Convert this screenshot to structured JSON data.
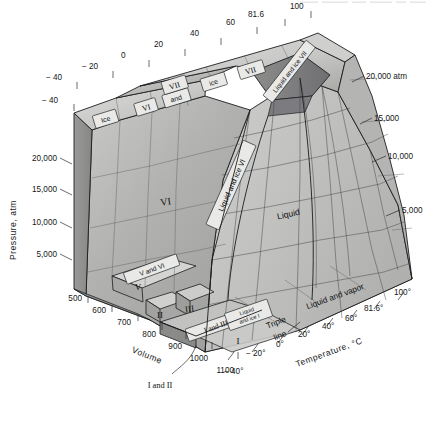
{
  "figure": {
    "type": "pvt-phase-diagram",
    "background_color": "#ffffff",
    "line_color": "#1b1d1f"
  },
  "axes": {
    "pressure": {
      "title": "Pressure, atm",
      "orientation": "vertical-left",
      "ticks": [
        "20,000",
        "15,000",
        "10,000",
        "5,000"
      ]
    },
    "pressure_right": {
      "orientation": "vertical-right",
      "ticks": [
        "20,000 atm",
        "15,000",
        "10,000",
        "5,000"
      ]
    },
    "volume": {
      "title": "Volume",
      "orientation": "depth-lower-left",
      "ticks": [
        "500",
        "600",
        "700",
        "800",
        "900",
        "1000",
        "1100"
      ]
    },
    "temperature_bottom": {
      "title": "Temperature, °C",
      "orientation": "depth-lower-right",
      "ticks": [
        "− 40°",
        "− 20°",
        "0°",
        "20°",
        "40°",
        "60°",
        "81.6°",
        "100°"
      ]
    },
    "temperature_top": {
      "orientation": "depth-upper",
      "ticks": [
        "− 40",
        "− 20",
        "0",
        "20",
        "40",
        "60",
        "81.6",
        "100"
      ]
    }
  },
  "regions": [
    {
      "id": "ice-vi-and-vii",
      "label": "Ice VI and VII",
      "style": "boxed-band"
    },
    {
      "id": "ice-vii",
      "label": "ice VII",
      "style": "boxed-band"
    },
    {
      "id": "liquid-and-ice-vii",
      "label": "Liquid and ice VII",
      "style": "boxed-band"
    },
    {
      "id": "vi",
      "label": "VI",
      "style": "plain"
    },
    {
      "id": "liquid-and-ice-vi",
      "label": "Liquid and ice VI",
      "style": "boxed-band"
    },
    {
      "id": "liquid",
      "label": "Liquid",
      "style": "plain"
    },
    {
      "id": "liquid-and-vapor",
      "label": "Liquid and vapor",
      "style": "plain"
    },
    {
      "id": "v-and-vi",
      "label": "V and VI",
      "style": "boxed-band"
    },
    {
      "id": "v",
      "label": "V",
      "style": "plain"
    },
    {
      "id": "ii",
      "label": "II",
      "style": "plain"
    },
    {
      "id": "iii",
      "label": "III",
      "style": "plain"
    },
    {
      "id": "i-and-iii",
      "label": "I and III",
      "style": "boxed-band"
    },
    {
      "id": "liquid-and-ice-i",
      "label": "Liquid and ice I",
      "style": "boxed-band"
    },
    {
      "id": "i",
      "label": "I",
      "style": "plain"
    },
    {
      "id": "i-and-ii",
      "label": "I and II",
      "style": "callout"
    },
    {
      "id": "triple-line",
      "label": "Triple line",
      "style": "callout"
    }
  ],
  "region_labels": {
    "ice_vi_and_vii_a": "Ice",
    "ice_vi_and_vii_b": "VI",
    "ice_vi_and_vii_c": "and",
    "ice_vi_and_vii_d": "VII",
    "ice_vii_a": "ice",
    "ice_vii_b": "VII",
    "liquid_and_ice_vii": "Liquid and ice VII",
    "vi": "VI",
    "liquid_and_ice_vi": "Liquid and ice VI",
    "liquid": "Liquid",
    "liquid_and_vapor": "Liquid and vapor",
    "v_and_vi": "V and VI",
    "v": "V",
    "ii": "II",
    "iii": "III",
    "i_and_iii": "I and III",
    "liquid_and_ice_i_a": "Liquid",
    "liquid_and_ice_i_b": "and ice I",
    "i": "I",
    "i_and_ii": "I and II",
    "triple_a": "Triple",
    "triple_b": "line"
  },
  "surface_colors": {
    "top_light": "#d8d8d6",
    "top_mid": "#c4c4c2",
    "top_dark": "#a9a9a7",
    "face_mid": "#b7b7b5",
    "face_dark": "#8e8e8c",
    "face_darker": "#76767a",
    "vapor_plane": "#dcdcda",
    "liquid_plane": "#c9c9c7",
    "label_box": "#e9e9e7"
  }
}
